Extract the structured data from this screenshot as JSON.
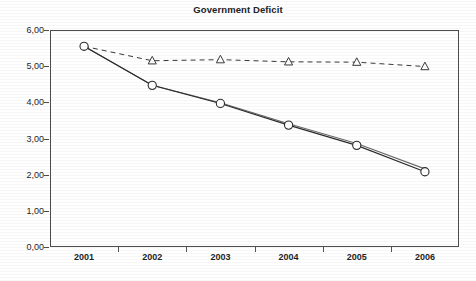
{
  "chart_data": {
    "type": "line",
    "title": "Government Deficit",
    "xlabel": "",
    "ylabel": "",
    "categories": [
      "2001",
      "2002",
      "2003",
      "2004",
      "2005",
      "2006"
    ],
    "x_tick_labels": [
      "2001",
      "2002",
      "2003",
      "2004",
      "2005",
      "2006"
    ],
    "y_tick_labels": [
      "0,00",
      "1,00",
      "2,00",
      "3,00",
      "4,00",
      "5,00",
      "6,00"
    ],
    "y_tick_values": [
      0,
      1,
      2,
      3,
      4,
      5,
      6
    ],
    "ylim": [
      0,
      6
    ],
    "grid": false,
    "legend_position": "none",
    "decimal_separator": ",",
    "series": [
      {
        "name": "dashed-triangle-series",
        "marker": "triangle",
        "line_style": "dashed",
        "color": "#3a3a3a",
        "values": [
          5.55,
          5.15,
          5.18,
          5.12,
          5.11,
          4.99
        ]
      },
      {
        "name": "solid-circle-series",
        "marker": "circle",
        "line_style": "solid",
        "color": "#2b2b2b",
        "values": [
          5.55,
          4.47,
          3.97,
          3.37,
          2.81,
          2.08
        ]
      },
      {
        "name": "solid-secondary-series",
        "marker": "none",
        "line_style": "solid",
        "color": "#6a6a6a",
        "values": [
          5.55,
          4.47,
          3.99,
          3.41,
          2.86,
          2.16
        ]
      }
    ]
  },
  "colors": {
    "axis": "#4d4d4d",
    "text": "#1f1f1f",
    "background": "#ffffff"
  }
}
